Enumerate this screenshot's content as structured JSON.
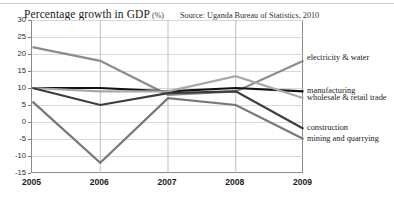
{
  "header": {
    "title": "Percentage growth in GDP",
    "unit": "(%)",
    "source": "Source: Uganda Bureau of Statistics, 2010"
  },
  "chart_data": {
    "type": "line",
    "subtitle": "Source: Uganda Bureau of Statistics, 2010",
    "xlabel": "",
    "ylabel": "",
    "categories": [
      "2005",
      "2006",
      "2007",
      "2008",
      "2009"
    ],
    "x": [
      2005,
      2006,
      2007,
      2008,
      2009
    ],
    "ylim": [
      -15,
      30
    ],
    "yticks": [
      30,
      25,
      20,
      15,
      10,
      5,
      0,
      -5,
      -10,
      -15
    ],
    "ytick_labels": [
      "30",
      "25",
      "20",
      "15",
      "10",
      "5",
      "0",
      "-5",
      "-10",
      "-15"
    ],
    "grid": true,
    "legend_position": "right-inline",
    "series": [
      {
        "name": "electricity & water",
        "color": "#8c8c8c",
        "values": [
          22,
          18,
          8,
          9,
          18
        ]
      },
      {
        "name": "manufacturing",
        "color": "#111111",
        "values": [
          10,
          10,
          9,
          10,
          9
        ]
      },
      {
        "name": "wholesale & retail trade",
        "color": "#a8a8a8",
        "values": [
          10,
          9,
          9,
          13.5,
          7
        ]
      },
      {
        "name": "construction",
        "color": "#3c3c3c",
        "values": [
          10,
          5,
          8.5,
          9,
          -2
        ]
      },
      {
        "name": "mining and quarrying",
        "color": "#777777",
        "values": [
          6,
          -12,
          7,
          5,
          -5
        ]
      }
    ]
  },
  "axis": {
    "y_labels": [
      "30",
      "25",
      "20",
      "15",
      "10",
      "5",
      "0",
      "-5",
      "-10",
      "-15"
    ],
    "x_labels": [
      "2005",
      "2006",
      "2007",
      "2008",
      "2009"
    ]
  },
  "legend": {
    "items": [
      {
        "label": "electricity & water"
      },
      {
        "label": "manufacturing"
      },
      {
        "label": "wholesale & retail trade"
      },
      {
        "label": "construction"
      },
      {
        "label": "mining and quarrying"
      }
    ]
  }
}
